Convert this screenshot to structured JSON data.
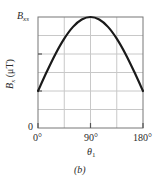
{
  "chart_data": {
    "type": "line",
    "title": "",
    "panel_label": "(b)",
    "xlabel": "θ",
    "xlabel_subscript": "1",
    "ylabel": "B",
    "ylabel_subscript": "x",
    "ylabel_unit": "(μT)",
    "xlim": [
      0,
      180
    ],
    "ylim": [
      0,
      1
    ],
    "x_ticks": [
      "0°",
      "90°",
      "180°"
    ],
    "x_tick_values": [
      0,
      90,
      180
    ],
    "y_ticks": [
      "0",
      "B_xs"
    ],
    "y_tick_labels": {
      "zero": "0",
      "max_main": "B",
      "max_sub": "xs"
    },
    "y_tick_values": [
      0,
      1
    ],
    "grid": true,
    "grid_x_divisions": 4,
    "grid_y_divisions": 6,
    "series": [
      {
        "name": "B_x vs θ1",
        "color": "#1a1a1a",
        "x": [
          0,
          15,
          30,
          45,
          60,
          75,
          90,
          105,
          120,
          135,
          150,
          165,
          180
        ],
        "values": [
          0.333,
          0.506,
          0.667,
          0.805,
          0.911,
          0.977,
          1.0,
          0.977,
          0.911,
          0.805,
          0.667,
          0.506,
          0.333
        ]
      }
    ],
    "colors": {
      "grid": "#c8c8c8",
      "axis": "#555555",
      "curve": "#1a1a1a"
    }
  }
}
